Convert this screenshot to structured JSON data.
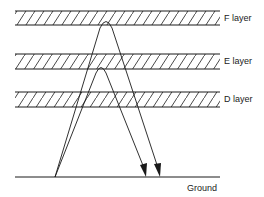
{
  "diagram": {
    "colors": {
      "line": "#1a1a1a",
      "background": "#ffffff"
    },
    "layers": [
      {
        "id": "f",
        "label": "F layer",
        "top": 11,
        "bottom": 25
      },
      {
        "id": "e",
        "label": "E layer",
        "top": 54,
        "bottom": 69
      },
      {
        "id": "d",
        "label": "D layer",
        "top": 92,
        "bottom": 107
      }
    ],
    "ground": {
      "label": "Ground",
      "y": 177,
      "x1": 15,
      "x2": 220
    },
    "rays": [
      {
        "id": "f-ray",
        "reflects_at": "F layer",
        "from_x": 55,
        "to_x": 160,
        "peak_x": 106,
        "peak_y": 20
      },
      {
        "id": "e-ray",
        "reflects_at": "E layer",
        "from_x": 55,
        "to_x": 146,
        "peak_x": 101,
        "peak_y": 66
      }
    ]
  }
}
